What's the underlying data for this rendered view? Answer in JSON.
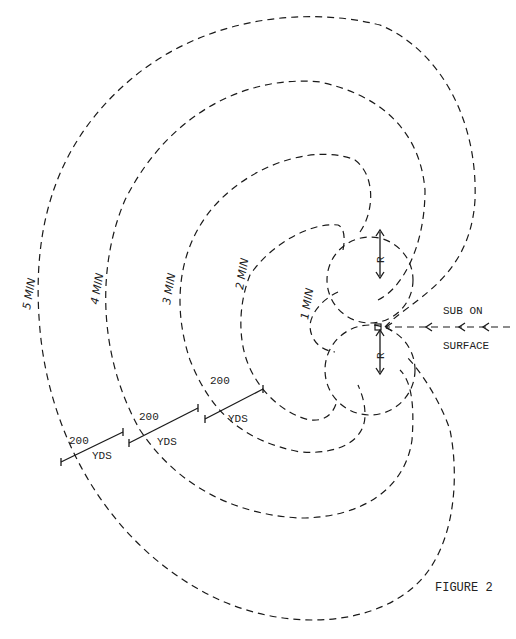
{
  "figure": {
    "caption": "FIGURE 2",
    "contours": [
      {
        "label": "1 MIN"
      },
      {
        "label": "2 MIN"
      },
      {
        "label": "3 MIN"
      },
      {
        "label": "4 MIN"
      },
      {
        "label": "5 MIN"
      }
    ],
    "scale_bars": [
      {
        "value": "200",
        "unit": "YDS"
      },
      {
        "value": "200",
        "unit": "YDS"
      },
      {
        "value": "200",
        "unit": "YDS"
      }
    ],
    "radius_label_top": "R",
    "radius_label_bottom": "R",
    "sub_label_line1": "SUB ON",
    "sub_label_line2": "SURFACE",
    "point_label": "P"
  },
  "colors": {
    "line": "#1a1a1a",
    "background": "#ffffff"
  }
}
